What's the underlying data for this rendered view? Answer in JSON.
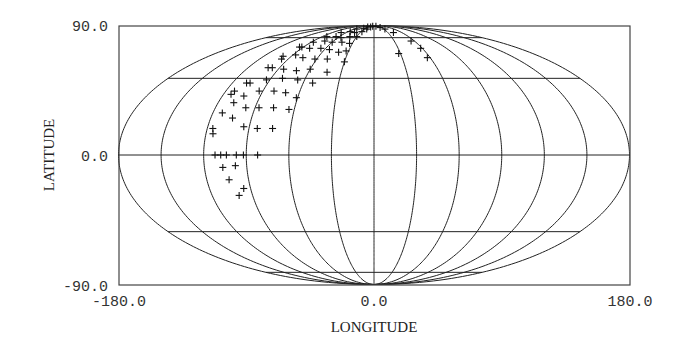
{
  "chart_data": {
    "type": "scatter",
    "projection": "mollweide",
    "title": "",
    "xlabel": "LONGITUDE",
    "ylabel": "LATITUDE",
    "xlim": [
      -180.0,
      180.0
    ],
    "ylim": [
      -90.0,
      90.0
    ],
    "x_ticks": [
      "-180.0",
      "0.0",
      "180.0"
    ],
    "y_ticks": [
      "90.0",
      "0.0",
      "-90.0"
    ],
    "grid": true,
    "meridians_deg": [
      -180,
      -150,
      -120,
      -90,
      -60,
      -30,
      0,
      30,
      60,
      90,
      120,
      150,
      180
    ],
    "parallels_deg": [
      -75,
      -45,
      0,
      45,
      75
    ],
    "marker": "+",
    "points": [
      {
        "lon": -112,
        "lat": 0
      },
      {
        "lon": -108,
        "lat": 0
      },
      {
        "lon": -104,
        "lat": 0
      },
      {
        "lon": -97,
        "lat": 0
      },
      {
        "lon": -92,
        "lat": 0
      },
      {
        "lon": -82,
        "lat": 0
      },
      {
        "lon": -107,
        "lat": -7
      },
      {
        "lon": -98,
        "lat": -6
      },
      {
        "lon": -104,
        "lat": -14
      },
      {
        "lon": -95,
        "lat": -19
      },
      {
        "lon": -100,
        "lat": -23
      },
      {
        "lon": -116,
        "lat": 15
      },
      {
        "lon": -115,
        "lat": 12
      },
      {
        "lon": -104,
        "lat": 21
      },
      {
        "lon": -94,
        "lat": 16
      },
      {
        "lon": -84,
        "lat": 15
      },
      {
        "lon": -73,
        "lat": 15
      },
      {
        "lon": -113,
        "lat": 24
      },
      {
        "lon": -108,
        "lat": 30
      },
      {
        "lon": -97,
        "lat": 27
      },
      {
        "lon": -87,
        "lat": 27
      },
      {
        "lon": -76,
        "lat": 27
      },
      {
        "lon": -64,
        "lat": 26
      },
      {
        "lon": -114,
        "lat": 35
      },
      {
        "lon": -113,
        "lat": 37
      },
      {
        "lon": -103,
        "lat": 34
      },
      {
        "lon": -93,
        "lat": 37
      },
      {
        "lon": -81,
        "lat": 37
      },
      {
        "lon": -71,
        "lat": 36
      },
      {
        "lon": -61,
        "lat": 33
      },
      {
        "lon": -108,
        "lat": 42
      },
      {
        "lon": -105,
        "lat": 42
      },
      {
        "lon": -93,
        "lat": 44
      },
      {
        "lon": -80,
        "lat": 45
      },
      {
        "lon": -66,
        "lat": 44
      },
      {
        "lon": -52,
        "lat": 42
      },
      {
        "lon": -101,
        "lat": 52
      },
      {
        "lon": -97,
        "lat": 52
      },
      {
        "lon": -85,
        "lat": 51
      },
      {
        "lon": -72,
        "lat": 50
      },
      {
        "lon": -60,
        "lat": 51
      },
      {
        "lon": -43,
        "lat": 49
      },
      {
        "lon": -30,
        "lat": 56
      },
      {
        "lon": -99,
        "lat": 60
      },
      {
        "lon": -97,
        "lat": 58
      },
      {
        "lon": -87,
        "lat": 61
      },
      {
        "lon": -76,
        "lat": 59
      },
      {
        "lon": -62,
        "lat": 58
      },
      {
        "lon": -49,
        "lat": 58
      },
      {
        "lon": -95,
        "lat": 67
      },
      {
        "lon": -92,
        "lat": 67
      },
      {
        "lon": -80,
        "lat": 66
      },
      {
        "lon": -66,
        "lat": 66
      },
      {
        "lon": -54,
        "lat": 65
      },
      {
        "lon": -41,
        "lat": 63
      },
      {
        "lon": -33,
        "lat": 64
      },
      {
        "lon": -87,
        "lat": 71
      },
      {
        "lon": -73,
        "lat": 72
      },
      {
        "lon": -60,
        "lat": 71
      },
      {
        "lon": -46,
        "lat": 71
      },
      {
        "lon": -34,
        "lat": 70
      },
      {
        "lon": -82,
        "lat": 76
      },
      {
        "lon": -66,
        "lat": 76
      },
      {
        "lon": -55,
        "lat": 75
      },
      {
        "lon": -42,
        "lat": 76
      },
      {
        "lon": -30,
        "lat": 76
      },
      {
        "lon": -71,
        "lat": 80
      },
      {
        "lon": -55,
        "lat": 81
      },
      {
        "lon": -42,
        "lat": 80
      },
      {
        "lon": -28,
        "lat": 81
      },
      {
        "lon": -52,
        "lat": 84
      },
      {
        "lon": -35,
        "lat": 85
      },
      {
        "lon": -22,
        "lat": 84
      },
      {
        "lon": -30,
        "lat": 87
      },
      {
        "lon": -16,
        "lat": 87
      },
      {
        "lon": -8,
        "lat": 88
      },
      {
        "lon": 12,
        "lat": 88
      },
      {
        "lon": 24,
        "lat": 86
      },
      {
        "lon": 33,
        "lat": 84
      },
      {
        "lon": 42,
        "lat": 80
      },
      {
        "lon": 55,
        "lat": 72
      },
      {
        "lon": 58,
        "lat": 66
      },
      {
        "lon": 57,
        "lat": 59
      },
      {
        "lon": 28,
        "lat": 62
      }
    ]
  }
}
